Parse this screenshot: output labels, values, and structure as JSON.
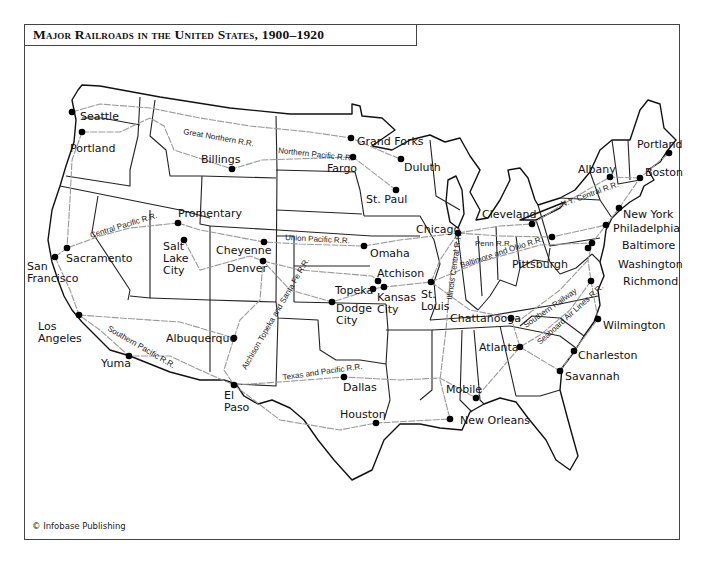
{
  "title": "Major Railroads in the United States, 1900–1920",
  "credit": "© Infobase Publishing",
  "colors": {
    "border": "#444444",
    "railroad": "#9a9a9a",
    "state_line": "#222222",
    "city_dot": "#000000"
  },
  "cities": [
    {
      "name": "Seattle",
      "x": 72,
      "y": 112,
      "lx": 80,
      "ly": 120,
      "lines": [
        "Seattle"
      ]
    },
    {
      "name": "Portland",
      "x": 82,
      "y": 132,
      "lx": 70,
      "ly": 152,
      "lines": [
        "Portland"
      ]
    },
    {
      "name": "Billings",
      "x": 232,
      "y": 169,
      "lx": 201,
      "ly": 163,
      "lines": [
        "Billings"
      ]
    },
    {
      "name": "Grand Forks",
      "x": 351,
      "y": 138,
      "lx": 357,
      "ly": 145,
      "lines": [
        "Grand Forks"
      ]
    },
    {
      "name": "Fargo",
      "x": 353,
      "y": 157,
      "lx": 327,
      "ly": 172,
      "lines": [
        "Fargo"
      ]
    },
    {
      "name": "Duluth",
      "x": 401,
      "y": 159,
      "lx": 404,
      "ly": 171,
      "lines": [
        "Duluth"
      ]
    },
    {
      "name": "St. Paul",
      "x": 396,
      "y": 190,
      "lx": 366,
      "ly": 203,
      "lines": [
        "St. Paul"
      ]
    },
    {
      "name": "Portland",
      "x": 669,
      "y": 153,
      "lx": 637,
      "ly": 148,
      "lines": [
        "Portland"
      ]
    },
    {
      "name": "Albany",
      "x": 610,
      "y": 177,
      "lx": 578,
      "ly": 173,
      "lines": [
        "Albany"
      ]
    },
    {
      "name": "Boston",
      "x": 640,
      "y": 178,
      "lx": 645,
      "ly": 176,
      "lines": [
        "Boston"
      ]
    },
    {
      "name": "New York",
      "x": 619,
      "y": 208,
      "lx": 623,
      "ly": 218,
      "lines": [
        "New York"
      ]
    },
    {
      "name": "Cleveland",
      "x": 532,
      "y": 224,
      "lx": 482,
      "ly": 218,
      "lines": [
        "Cleveland"
      ]
    },
    {
      "name": "Chicago",
      "x": 458,
      "y": 233,
      "lx": 416,
      "ly": 233,
      "lines": [
        "Chicago"
      ]
    },
    {
      "name": "Philadelphia",
      "x": 606,
      "y": 225,
      "lx": 613,
      "ly": 232,
      "lines": [
        "Philadelphia"
      ]
    },
    {
      "name": "Pittsburgh",
      "x": 552,
      "y": 237,
      "lx": 512,
      "ly": 268,
      "lines": [
        "Pittsburgh"
      ]
    },
    {
      "name": "Baltimore",
      "x": 592,
      "y": 243,
      "lx": 622,
      "ly": 249,
      "lines": [
        "Baltimore"
      ]
    },
    {
      "name": "Washington",
      "x": 588,
      "y": 248,
      "lx": 618,
      "ly": 268,
      "lines": [
        "Washington"
      ]
    },
    {
      "name": "Richmond",
      "x": 591,
      "y": 281,
      "lx": 623,
      "ly": 285,
      "lines": [
        "Richmond"
      ]
    },
    {
      "name": "Promentary",
      "x": 178,
      "y": 223,
      "lx": 178,
      "ly": 217,
      "lines": [
        "Promentary"
      ]
    },
    {
      "name": "Salt Lake City",
      "x": 184,
      "y": 240,
      "lx": 163,
      "ly": 250,
      "lines": [
        "Salt",
        "Lake",
        "City"
      ]
    },
    {
      "name": "Cheyenne",
      "x": 264,
      "y": 242,
      "lx": 216,
      "ly": 254,
      "lines": [
        "Cheyenne"
      ]
    },
    {
      "name": "Denver",
      "x": 263,
      "y": 261,
      "lx": 227,
      "ly": 272,
      "lines": [
        "Denver"
      ]
    },
    {
      "name": "Sacramento",
      "x": 67,
      "y": 248,
      "lx": 66,
      "ly": 262,
      "lines": [
        "Sacramento"
      ]
    },
    {
      "name": "San Francisco",
      "x": 55,
      "y": 257,
      "lx": 27,
      "ly": 270,
      "lines": [
        "San",
        "Francisco"
      ]
    },
    {
      "name": "Omaha",
      "x": 364,
      "y": 246,
      "lx": 370,
      "ly": 257,
      "lines": [
        "Omaha"
      ]
    },
    {
      "name": "Atchison",
      "x": 378,
      "y": 281,
      "lx": 377,
      "ly": 277,
      "lines": [
        "Atchison"
      ]
    },
    {
      "name": "Topeka",
      "x": 373,
      "y": 289,
      "lx": 335,
      "ly": 294,
      "lines": [
        "Topeka"
      ]
    },
    {
      "name": "Kansas City",
      "x": 384,
      "y": 287,
      "lx": 377,
      "ly": 301,
      "lines": [
        "Kansas",
        "City"
      ]
    },
    {
      "name": "St. Louis",
      "x": 431,
      "y": 282,
      "lx": 421,
      "ly": 298,
      "lines": [
        "St.",
        "Louis"
      ]
    },
    {
      "name": "Dodge City",
      "x": 332,
      "y": 302,
      "lx": 336,
      "ly": 312,
      "lines": [
        "Dodge",
        "City"
      ]
    },
    {
      "name": "Chattanooga",
      "x": 511,
      "y": 318,
      "lx": 450,
      "ly": 322,
      "lines": [
        "Chattanooga"
      ]
    },
    {
      "name": "Wilmington",
      "x": 598,
      "y": 319,
      "lx": 603,
      "ly": 329,
      "lines": [
        "Wilmington"
      ]
    },
    {
      "name": "Atlanta",
      "x": 520,
      "y": 347,
      "lx": 479,
      "ly": 351,
      "lines": [
        "Atlanta"
      ]
    },
    {
      "name": "Charleston",
      "x": 574,
      "y": 351,
      "lx": 578,
      "ly": 359,
      "lines": [
        "Charleston"
      ]
    },
    {
      "name": "Savannah",
      "x": 560,
      "y": 371,
      "lx": 565,
      "ly": 380,
      "lines": [
        "Savannah"
      ]
    },
    {
      "name": "Los Angeles",
      "x": 79,
      "y": 315,
      "lx": 38,
      "ly": 330,
      "lines": [
        "Los",
        "Angeles"
      ]
    },
    {
      "name": "Albuquerque",
      "x": 234,
      "y": 338,
      "lx": 166,
      "ly": 342,
      "lines": [
        "Albuquerque"
      ]
    },
    {
      "name": "Yuma",
      "x": 129,
      "y": 356,
      "lx": 101,
      "ly": 367,
      "lines": [
        "Yuma"
      ]
    },
    {
      "name": "El Paso",
      "x": 234,
      "y": 385,
      "lx": 224,
      "ly": 399,
      "lines": [
        "El",
        "Paso"
      ]
    },
    {
      "name": "Dallas",
      "x": 344,
      "y": 377,
      "lx": 343,
      "ly": 391,
      "lines": [
        "Dallas"
      ]
    },
    {
      "name": "Houston",
      "x": 376,
      "y": 423,
      "lx": 340,
      "ly": 418,
      "lines": [
        "Houston"
      ]
    },
    {
      "name": "Mobile",
      "x": 476,
      "y": 398,
      "lx": 446,
      "ly": 393,
      "lines": [
        "Mobile"
      ]
    },
    {
      "name": "New Orleans",
      "x": 450,
      "y": 419,
      "lx": 460,
      "ly": 424,
      "lines": [
        "New Orleans"
      ]
    }
  ],
  "railroads": [
    {
      "name": "Great Northern R.R.",
      "label_x": 183,
      "label_y": 134,
      "angle": 10
    },
    {
      "name": "Northern Pacific R.R.",
      "label_x": 278,
      "label_y": 153,
      "angle": 6
    },
    {
      "name": "Central Pacific R.R.",
      "label_x": 91,
      "label_y": 238,
      "angle": -17
    },
    {
      "name": "Union Pacific R.R.",
      "label_x": 285,
      "label_y": 240,
      "angle": 3
    },
    {
      "name": "Atchison Topeka and Santa Fe R.R.",
      "label_x": 246,
      "label_y": 370,
      "angle": -60
    },
    {
      "name": "Southern Pacific R.R.",
      "label_x": 107,
      "label_y": 330,
      "angle": 30
    },
    {
      "name": "Texas and Pacific R.R.",
      "label_x": 283,
      "label_y": 380,
      "angle": -8
    },
    {
      "name": "Illinois Central R.R.",
      "label_x": 452,
      "label_y": 300,
      "angle": -82
    },
    {
      "name": "Penn R.R.",
      "label_x": 475,
      "label_y": 246,
      "angle": 0
    },
    {
      "name": "Baltimore and Ohio R.R.",
      "label_x": 461,
      "label_y": 268,
      "angle": -18
    },
    {
      "name": "N.Y. Central R.R.",
      "label_x": 562,
      "label_y": 207,
      "angle": -20
    },
    {
      "name": "Southern Railway",
      "label_x": 526,
      "label_y": 328,
      "angle": -35
    },
    {
      "name": "Seaboard Air Lines R.R.",
      "label_x": 540,
      "label_y": 345,
      "angle": -42
    }
  ]
}
